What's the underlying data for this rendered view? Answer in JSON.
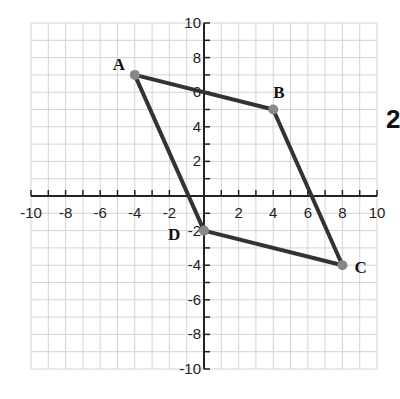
{
  "diagram": {
    "type": "coordinate-plane",
    "x_range": [
      -10,
      10
    ],
    "y_range": [
      -10,
      10
    ],
    "x_tick_labels": [
      "-10",
      "-8",
      "-6",
      "-4",
      "-2",
      "2",
      "4",
      "6",
      "8",
      "10"
    ],
    "y_tick_labels": [
      "10",
      "8",
      "6",
      "4",
      "2",
      "-2",
      "-4",
      "-6",
      "-8",
      "-10"
    ],
    "grid": true,
    "shape": "parallelogram",
    "vertices": [
      {
        "label": "A",
        "x": -4,
        "y": 7
      },
      {
        "label": "B",
        "x": 4,
        "y": 5
      },
      {
        "label": "C",
        "x": 8,
        "y": -4
      },
      {
        "label": "D",
        "x": 0,
        "y": -2
      }
    ],
    "line_color": "#333333",
    "point_color": "#888888"
  },
  "side_label": "2"
}
